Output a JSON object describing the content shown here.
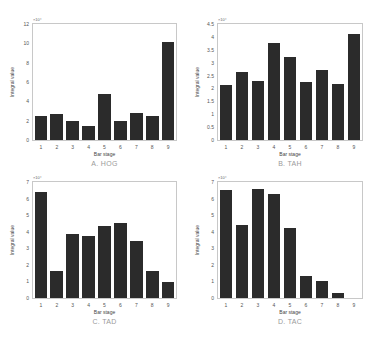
{
  "chart_data": [
    {
      "type": "bar",
      "title": "A. HOG",
      "xlabel": "Bar stage",
      "ylabel": "Integral value",
      "y_exponent": "×10⁴",
      "categories": [
        "1",
        "2",
        "3",
        "4",
        "5",
        "6",
        "7",
        "8",
        "9"
      ],
      "values": [
        2.5,
        2.7,
        2.0,
        1.4,
        4.8,
        2.0,
        2.8,
        2.5,
        10.1
      ],
      "ylim": [
        0,
        12
      ],
      "yticks": [
        "0",
        "2",
        "4",
        "6",
        "8",
        "10",
        "12"
      ],
      "grid": false,
      "bar_color": "#2b2b2b"
    },
    {
      "type": "bar",
      "title": "B. TAH",
      "xlabel": "Bar stage",
      "ylabel": "Integral value",
      "y_exponent": "×10⁴",
      "categories": [
        "1",
        "2",
        "3",
        "4",
        "5",
        "6",
        "7",
        "8",
        "9"
      ],
      "values": [
        2.15,
        2.65,
        2.28,
        3.78,
        3.22,
        2.24,
        2.7,
        2.17,
        4.13
      ],
      "ylim": [
        0,
        4.5
      ],
      "yticks": [
        "0",
        "0.5",
        "1",
        "1.5",
        "2",
        "2.5",
        "3",
        "3.5",
        "4",
        "4.5"
      ],
      "grid": false,
      "bar_color": "#2b2b2b"
    },
    {
      "type": "bar",
      "title": "C. TAD",
      "xlabel": "Bar stage",
      "ylabel": "Integral value",
      "y_exponent": "×10⁴",
      "categories": [
        "1",
        "2",
        "3",
        "4",
        "5",
        "6",
        "7",
        "8",
        "9"
      ],
      "values": [
        6.4,
        1.65,
        3.85,
        3.75,
        4.35,
        4.5,
        3.45,
        1.65,
        0.95
      ],
      "ylim": [
        0,
        7
      ],
      "yticks": [
        "0",
        "1",
        "2",
        "3",
        "4",
        "5",
        "6",
        "7"
      ],
      "grid": false,
      "bar_color": "#2b2b2b"
    },
    {
      "type": "bar",
      "title": "D. TAC",
      "xlabel": "Bar stage",
      "ylabel": "Integral value",
      "y_exponent": "×10⁴",
      "categories": [
        "1",
        "2",
        "3",
        "4",
        "5",
        "6",
        "7",
        "8",
        "9"
      ],
      "values": [
        6.5,
        4.4,
        6.6,
        6.3,
        4.25,
        1.3,
        1.05,
        0.3,
        0.0
      ],
      "ylim": [
        0,
        7
      ],
      "yticks": [
        "0",
        "1",
        "2",
        "3",
        "4",
        "5",
        "6",
        "7"
      ],
      "grid": false,
      "bar_color": "#2b2b2b"
    }
  ],
  "layout": [
    {
      "left": 32,
      "top": 23,
      "width": 145,
      "height": 118
    },
    {
      "left": 217,
      "top": 23,
      "width": 146,
      "height": 118
    },
    {
      "left": 32,
      "top": 181,
      "width": 145,
      "height": 118
    },
    {
      "left": 217,
      "top": 181,
      "width": 146,
      "height": 118
    }
  ]
}
